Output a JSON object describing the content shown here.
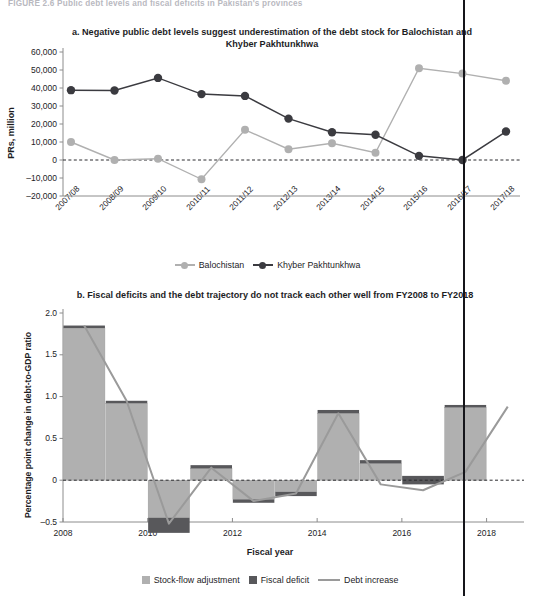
{
  "figure": {
    "header": "FIGURE 2.6    Public debt levels and fiscal deficits in Pakistan's provinces"
  },
  "colors": {
    "light_gray": "#b0b0b0",
    "dark_gray": "#58585b",
    "dark_line": "#3b3b40",
    "axis": "#8c8c8c",
    "text": "#1d1d1f",
    "cut_line": "#15151a"
  },
  "panel_a": {
    "title": "a. Negative public debt levels suggest underestimation of the debt stock for Balochistan and Khyber Pakhtunkhwa",
    "ylabel": "PRs, million",
    "yticks": [
      "60,000",
      "50,000",
      "40,000",
      "30,000",
      "20,000",
      "10,000",
      "0",
      "–10,000",
      "–20,000"
    ],
    "xticks": [
      "2007/08",
      "2008/09",
      "2009/10",
      "2010/11",
      "2011/12",
      "2012/13",
      "2013/14",
      "2014/15",
      "2015/16",
      "2016/17",
      "2017/18"
    ],
    "legend": [
      {
        "label": "Balochistan",
        "color": "#b0b0b0",
        "marker": "circle"
      },
      {
        "label": "Khyber Pakhtunkhwa",
        "color": "#3b3b40",
        "marker": "circle"
      }
    ]
  },
  "panel_b": {
    "title": "b. Fiscal deficits and the debt trajectory do not track each other well from  FY2008 to FY2018",
    "ylabel": "Percentage point change in debt-to-GDP ratio",
    "xlabel": "Fiscal year",
    "yticks": [
      "2.0",
      "1.5",
      "1.0",
      "0.5",
      "0",
      "–0.5"
    ],
    "xticks": [
      "2008",
      "2010",
      "2012",
      "2014",
      "2016",
      "2018"
    ],
    "legend": [
      {
        "label": "Stock-flow adjustment",
        "color": "#b0b0b0",
        "marker": "square"
      },
      {
        "label": "Fiscal deficit",
        "color": "#58585b",
        "marker": "square"
      },
      {
        "label": "Debt increase",
        "color": "#9a9a9a",
        "marker": "line"
      }
    ]
  },
  "chart_data": [
    {
      "type": "line",
      "title": "a. Negative public debt levels suggest underestimation of the debt stock for Balochistan and Khyber Pakhtunkhwa",
      "xlabel": "",
      "ylabel": "PRs, million",
      "categories": [
        "2007/08",
        "2008/09",
        "2009/10",
        "2010/11",
        "2011/12",
        "2012/13",
        "2013/14",
        "2014/15",
        "2015/16",
        "2016/17",
        "2017/18"
      ],
      "ylim": [
        -20000,
        60000
      ],
      "ytick_values": [
        -20000,
        -10000,
        0,
        10000,
        20000,
        30000,
        40000,
        50000,
        60000
      ],
      "grid": false,
      "zero_reference_line": true,
      "legend_position": "bottom",
      "series": [
        {
          "name": "Balochistan",
          "color": "#b0b0b0",
          "values": [
            10000,
            0,
            700,
            -10700,
            16800,
            6000,
            9300,
            4000,
            51000,
            48000,
            44000
          ]
        },
        {
          "name": "Khyber Pakhtunkhwa",
          "color": "#3b3b40",
          "values": [
            38800,
            38600,
            45600,
            36600,
            35600,
            23000,
            15400,
            14000,
            2300,
            0,
            15800
          ]
        }
      ]
    },
    {
      "type": "bar",
      "title": "b. Fiscal deficits and the debt trajectory do not track each other well from  FY2008 to FY2018",
      "xlabel": "Fiscal year",
      "ylabel": "Percentage point change in debt-to-GDP ratio",
      "categories": [
        2009,
        2010,
        2011,
        2012,
        2013,
        2014,
        2015,
        2016,
        2017,
        2018
      ],
      "xlim": [
        2008,
        2018.6
      ],
      "ylim": [
        -0.5,
        2.0
      ],
      "ytick_values": [
        -0.5,
        0,
        0.5,
        1.0,
        1.5,
        2.0
      ],
      "xtick_values": [
        2008,
        2010,
        2012,
        2014,
        2016,
        2018
      ],
      "grid": false,
      "stacked": true,
      "zero_reference_line": true,
      "legend_position": "bottom",
      "series": [
        {
          "name": "Stock-flow adjustment",
          "type": "bar",
          "color": "#b0b0b0",
          "values": [
            1.82,
            0.92,
            -0.45,
            0.14,
            -0.23,
            -0.14,
            0.8,
            0.2,
            0.05,
            0.87
          ]
        },
        {
          "name": "Fiscal deficit",
          "type": "bar",
          "color": "#58585b",
          "values": [
            0.03,
            0.03,
            -0.18,
            0.04,
            -0.04,
            -0.05,
            0.04,
            0.04,
            -0.1,
            0.03
          ]
        },
        {
          "name": "Debt increase",
          "type": "line",
          "color": "#9a9a9a",
          "x": [
            2008.5,
            2009.5,
            2010.5,
            2011.5,
            2012.5,
            2013.5,
            2014.5,
            2015.5,
            2016.5,
            2017.5,
            2018.5
          ],
          "values": [
            1.85,
            0.95,
            -0.52,
            0.15,
            -0.25,
            -0.16,
            0.8,
            -0.05,
            -0.12,
            0.1,
            0.88
          ]
        }
      ]
    }
  ]
}
